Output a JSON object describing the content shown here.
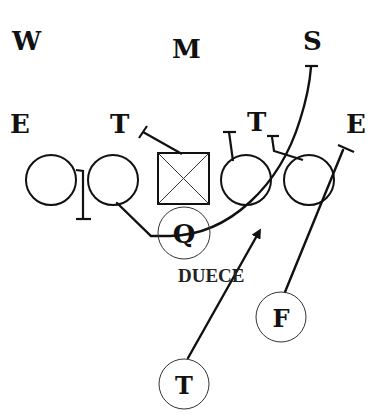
{
  "diagram": {
    "play_label": "DUECE",
    "defense": {
      "weak_linebacker": "W",
      "middle_linebacker": "M",
      "strong_linebacker": "S",
      "left_end": "E",
      "left_tackle": "T",
      "right_tackle": "T",
      "right_end": "E"
    },
    "offense": {
      "quarterback": "Q",
      "fullback": "F",
      "tailback": "T"
    },
    "colors": {
      "ink": "#111111",
      "background": "#ffffff"
    }
  }
}
